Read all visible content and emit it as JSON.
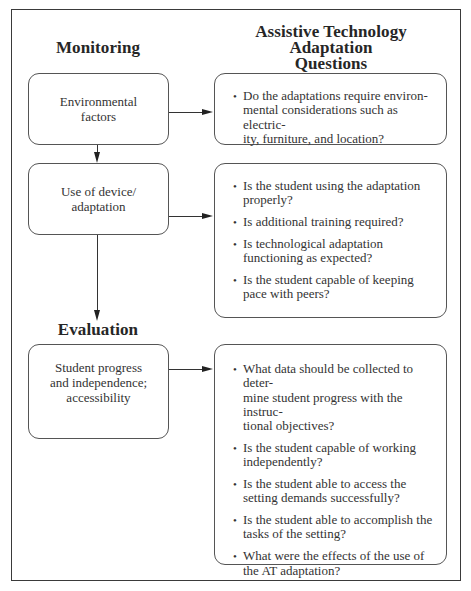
{
  "headings": {
    "monitoring": "Monitoring",
    "questions_line1": "Assistive Technology Adaptation",
    "questions_line2": "Questions",
    "evaluation": "Evaluation"
  },
  "steps": [
    {
      "label_lines": [
        "Environmental",
        "factors"
      ]
    },
    {
      "label_lines": [
        "Use of device/",
        "adaptation"
      ]
    },
    {
      "label_lines": [
        "Student progress",
        "and independence;",
        "accessibility"
      ]
    }
  ],
  "questions": [
    {
      "items": [
        "Do the adaptations require environ-mental considerations such as electric-ity, furniture, and location?"
      ]
    },
    {
      "items": [
        "Is the student using the adaptation properly?",
        "Is additional training required?",
        "Is technological adaptation functioning as expected?",
        "Is the student capable of keeping pace with peers?"
      ]
    },
    {
      "items": [
        "What data should be collected to deter-mine student progress with the instruc-tional objectives?",
        "Is the student capable of working independently?",
        "Is the student able to access the setting demands successfully?",
        "Is the student able to accomplish the tasks of the setting?",
        "What were the effects of the use of the AT adaptation?"
      ]
    }
  ],
  "bullet_glyph": "•",
  "colors": {
    "border": "#3a3a3a",
    "text": "#2a2a2a",
    "background": "#ffffff"
  }
}
